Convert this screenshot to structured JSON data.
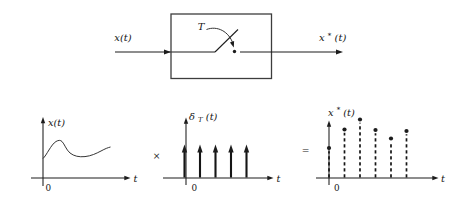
{
  "figure": {
    "background": "#ffffff",
    "ink": "#1c1c1c",
    "description_labels_only": true
  },
  "block_diagram": {
    "input_label": "x(t)",
    "switch_period_label": "T",
    "output_label_base": "x",
    "output_label_sup": "*",
    "output_label_suffix": "(t)"
  },
  "operators": {
    "multiply": "×",
    "equals": "="
  },
  "plots": {
    "input_signal": {
      "ylabel": "x(t)",
      "origin_label": "0",
      "xlabel": "t"
    },
    "impulse_train": {
      "ylabel_base": "δ",
      "ylabel_sub": "T",
      "ylabel_suffix": "(t)",
      "origin_label": "0",
      "xlabel": "t",
      "baseline_y_px": 178,
      "impulse_tip_y_px": 144.5,
      "impulse_positions_px": [
        184.5,
        200,
        215.5,
        231,
        246.5
      ]
    },
    "sampled_signal": {
      "ylabel_base": "x",
      "ylabel_sup": "*",
      "ylabel_suffix": "(t)",
      "origin_label": "0",
      "xlabel": "t",
      "baseline_y_px": 178,
      "stems_px": [
        [
          329,
          148
        ],
        [
          344.5,
          129.5
        ],
        [
          360,
          119.5
        ],
        [
          375.5,
          130
        ],
        [
          391,
          138.5
        ],
        [
          406.5,
          131
        ]
      ]
    }
  },
  "chart_data": [
    {
      "type": "line",
      "title": "x(t)",
      "xlabel": "t",
      "description": "continuous-time signal: rises to a bump, dips, then rises gently"
    },
    {
      "type": "bar",
      "title": "δT(t) impulse train",
      "xlabel": "t",
      "x": [
        0,
        1,
        2,
        3,
        4
      ],
      "values": [
        1,
        1,
        1,
        1,
        1
      ]
    },
    {
      "type": "scatter",
      "title": "x*(t) sampled signal",
      "xlabel": "t",
      "x": [
        0,
        1,
        2,
        3,
        4,
        5
      ],
      "values": [
        0.51,
        0.83,
        1.0,
        0.82,
        0.68,
        0.8
      ]
    }
  ]
}
